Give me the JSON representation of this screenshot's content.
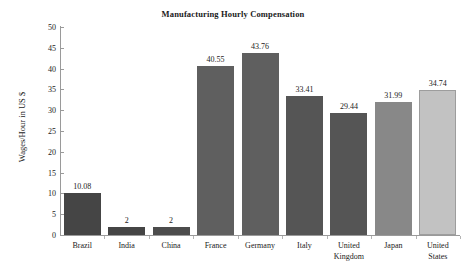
{
  "chart_data": {
    "type": "bar",
    "title": "Manufacturing Hourly Compensation",
    "xlabel": "",
    "ylabel": "Wages/Hour in US $",
    "ylim": [
      0,
      50
    ],
    "yticks": [
      0,
      5,
      10,
      15,
      20,
      25,
      30,
      35,
      40,
      45,
      50
    ],
    "grid": false,
    "legend": "none",
    "categories": [
      "Brazil",
      "India",
      "China",
      "France",
      "Germany",
      "Italy",
      "United Kingdom",
      "Japan",
      "United States"
    ],
    "values": [
      10.08,
      2,
      2,
      40.55,
      43.76,
      33.41,
      29.44,
      31.99,
      34.74
    ],
    "value_labels": [
      "10.08",
      "2",
      "2",
      "40.55",
      "43.76",
      "33.41",
      "29.44",
      "31.99",
      "34.74"
    ],
    "bar_colors": [
      "#454545",
      "#454545",
      "#4c4c4c",
      "#5f5f5f",
      "#5f5f5f",
      "#555555",
      "#555555",
      "#888888",
      "#c2c2c2"
    ]
  }
}
